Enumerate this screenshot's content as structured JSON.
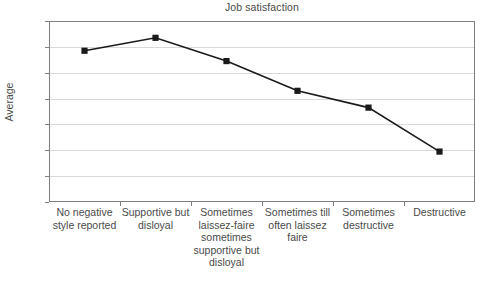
{
  "chart_data": {
    "type": "line",
    "title": "Job satisfaction",
    "xlabel": "",
    "ylabel": "Average",
    "ylim": [
      3,
      4.4
    ],
    "ytick_labels": [
      "4,4",
      "4,2",
      "4",
      "3,8",
      "3,6",
      "3,4",
      "3,2",
      "3"
    ],
    "ytick_values": [
      4.4,
      4.2,
      4.0,
      3.8,
      3.6,
      3.4,
      3.2,
      3.0
    ],
    "grid": true,
    "legend": "none",
    "categories": [
      "No negative style reported",
      "Supportive but disloyal",
      "Sometimes laissez-faire sometimes supportive but disloyal",
      "Sometimes till often laissez faire",
      "Sometimes destructive",
      "Destructive"
    ],
    "values": [
      4.17,
      4.27,
      4.09,
      3.86,
      3.73,
      3.39
    ],
    "series": [
      {
        "name": "Average",
        "values": [
          4.17,
          4.27,
          4.09,
          3.86,
          3.73,
          3.39
        ],
        "line_color": "#1a1a1a",
        "marker": "square",
        "marker_color": "#1a1a1a"
      }
    ],
    "colors": {
      "line": "#1a1a1a",
      "marker": "#1a1a1a",
      "gridline": "#d9d9d9",
      "axis": "#7f7f7f",
      "text": "#4a4a4a",
      "background": "#ffffff"
    }
  }
}
